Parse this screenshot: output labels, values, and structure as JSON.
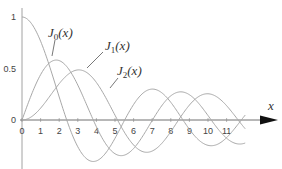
{
  "chart_data": {
    "type": "line",
    "title": "",
    "xlabel": "x",
    "ylabel": "",
    "xlim": [
      0,
      13.6
    ],
    "ylim": [
      -0.5,
      1
    ],
    "grid": false,
    "legend": "inline labels with leader lines",
    "x_ticks": [
      "0",
      "1",
      "2",
      "3",
      "4",
      "5",
      "6",
      "7",
      "8",
      "9",
      "10",
      "11"
    ],
    "y_ticks": [
      "1",
      "0.5",
      "0"
    ],
    "series": [
      {
        "name": "J0(x)",
        "label_main": "J",
        "label_sub": "0",
        "label_arg": "(x)",
        "function": "besselJ0"
      },
      {
        "name": "J1(x)",
        "label_main": "J",
        "label_sub": "1",
        "label_arg": "(x)",
        "function": "besselJ1"
      },
      {
        "name": "J2(x)",
        "label_main": "J",
        "label_sub": "2",
        "label_arg": "(x)",
        "function": "besselJ2"
      }
    ],
    "x_range_plotted": [
      0,
      12
    ],
    "colors": {
      "curve": "#a8a8a8",
      "axis": "#707070",
      "arrow": "#111111",
      "text": "#444444"
    }
  }
}
